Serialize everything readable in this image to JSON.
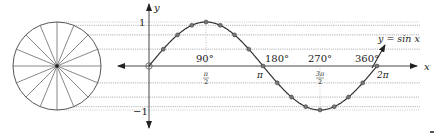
{
  "figure": {
    "type": "unit-circle-sine-projection",
    "equation_label": "y = sin x",
    "axis_labels": {
      "x": "x",
      "y": "y"
    },
    "y_ticks": [
      {
        "value": 1,
        "label": "1"
      },
      {
        "value": -1,
        "label": "−1"
      }
    ],
    "x_ticks": [
      {
        "radians": 1.5707963,
        "degree_label": "90°",
        "radian_label_num": "π",
        "radian_label_den": "2"
      },
      {
        "radians": 3.1415927,
        "degree_label": "180°",
        "radian_label": "π"
      },
      {
        "radians": 4.712389,
        "degree_label": "270°",
        "radian_label_num": "3π",
        "radian_label_den": "2"
      },
      {
        "radians": 6.2831853,
        "degree_label": "360°",
        "radian_label": "2π"
      }
    ],
    "circle": {
      "spokes": 16,
      "step_degrees": 22.5
    },
    "sample_points_step": "π/8",
    "colors": {
      "stroke": "#333333",
      "dotted": "#aaaaaa",
      "point_fill": "#777777",
      "background": "#ffffff"
    }
  },
  "labels": {
    "eq": "y = sin x",
    "x": "x",
    "y": "y",
    "one": "1",
    "neg_one": "−1",
    "deg90": "90°",
    "deg180": "180°",
    "deg270": "270°",
    "deg360": "360°",
    "pi": "π",
    "two_pi": "2π",
    "pi_num": "π",
    "three_pi_num": "3π",
    "den2": "2"
  }
}
